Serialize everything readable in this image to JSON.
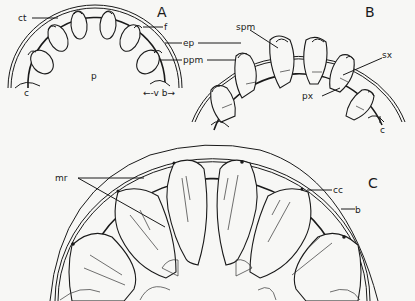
{
  "figure": {
    "panels": [
      {
        "id": "A",
        "label": "A",
        "annotations": [
          "ct",
          "f",
          "ep",
          "ppm",
          "p",
          "c",
          "v",
          "b"
        ]
      },
      {
        "id": "B",
        "label": "B",
        "annotations": [
          "spm",
          "sx",
          "px",
          "c"
        ]
      },
      {
        "id": "C",
        "label": "C",
        "annotations": [
          "mr",
          "cc",
          "b"
        ]
      }
    ],
    "labels": {
      "A": "A",
      "B": "B",
      "C": "C",
      "ct": "ct",
      "f": "f",
      "ep": "ep",
      "ppm": "ppm",
      "p": "p",
      "cA": "c",
      "vb": "←-v b→",
      "spm": "spm",
      "sx": "sx",
      "px": "px",
      "cB": "c",
      "mr": "mr",
      "cc": "cc",
      "b": "b"
    },
    "colors": {
      "ink": "#1a1a1a",
      "paper": "#f7f7f5"
    }
  }
}
